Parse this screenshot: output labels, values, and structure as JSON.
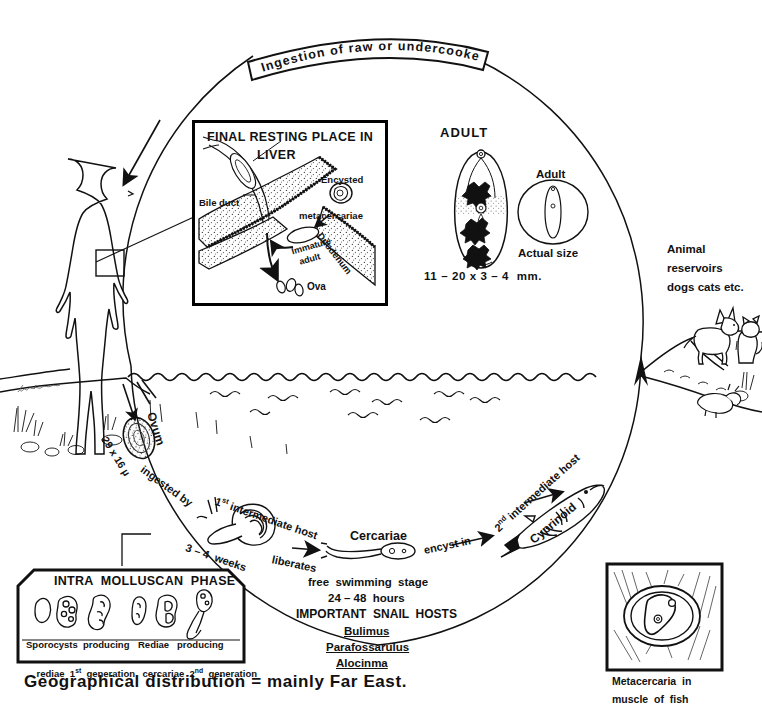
{
  "diagram": {
    "caption": "Geographical distribution = mainly Far East.",
    "top_banner": "Ingestion of raw or undercooked fish."
  },
  "liver_inset": {
    "title_line1": "FINAL RESTING PLACE IN",
    "title_line2": "LIVER",
    "labels": {
      "bile_duct": "Bile duct",
      "encysted": "Encysted",
      "metacercariae": "metacercariae",
      "immature": "Immature",
      "adult": "adult",
      "duodenum": "Duodenum",
      "ova": "Ova"
    }
  },
  "adult_panel": {
    "heading": "ADULT",
    "size": "11 – 20 x 3 – 4  mm.",
    "actual_label": "Adult",
    "actual_size": "Actual size"
  },
  "reservoirs": {
    "line1": "Animal",
    "line2": "reservoirs",
    "line3": "dogs cats etc."
  },
  "cycle_labels": {
    "ovum": "Ovum",
    "ovum_size": "29 x 16 µ",
    "ingested_by": "ingested by",
    "first_host": "1",
    "first_host_sup": "st",
    "first_host_rest": " intermediate host",
    "weeks": "3 – 4  weeks",
    "liberates": "liberates",
    "cercariae": "Cercariae",
    "free_swimming": "free  swimming  stage",
    "hours": "24 – 48  hours",
    "encyst_in": "encyst in",
    "second_host": "2",
    "second_host_sup": "nd",
    "second_host_rest": " intermediate host",
    "cyprinoid": "Cyprinoid"
  },
  "snail_hosts": {
    "heading": "IMPORTANT  SNAIL  HOSTS",
    "items": [
      "Bulimus",
      "Parafossarulus",
      "Alocinma"
    ]
  },
  "mollusc_box": {
    "title": "INTRA  MOLLUSCAN  PHASE",
    "left_line1": "Sporocysts  producing",
    "left_line2_a": "rediae  1",
    "left_line2_sup": "st",
    "left_line2_b": "  generation",
    "right_line1": "Rediae   producing",
    "right_line2_a": "cercariae  2",
    "right_line2_sup": "nd",
    "right_line2_b": "  generation"
  },
  "fish_inset": {
    "line1": "Metacercaria  in",
    "line2": "muscle  of  fish"
  },
  "colors": {
    "ink": "#111111",
    "paper": "#ffffff"
  }
}
